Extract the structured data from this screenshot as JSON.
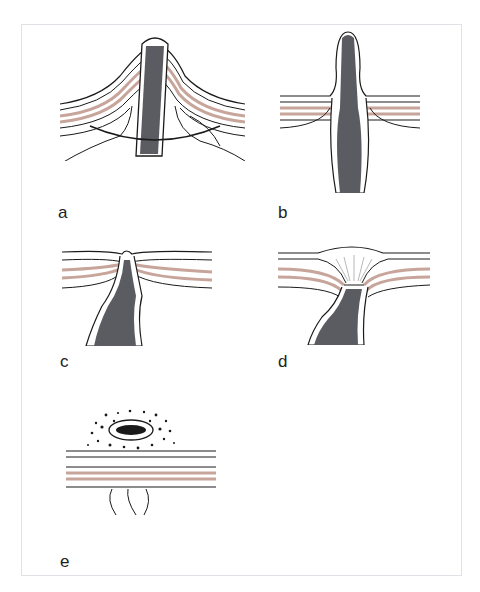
{
  "figure": {
    "panels": [
      {
        "id": "a",
        "label": "a",
        "description": "Bowel loop pulled through abdominal wall with rod/suture encircling"
      },
      {
        "id": "b",
        "label": "b",
        "description": "Everted bowel protruding through abdominal wall layers"
      },
      {
        "id": "c",
        "label": "c",
        "description": "Bowel retracted with layers converging at stoma"
      },
      {
        "id": "d",
        "label": "d",
        "description": "Stoma retracted below skin surface, depression in wall"
      },
      {
        "id": "e",
        "label": "e",
        "description": "Top view of stoma opening with surrounding granulation on abdominal wall"
      }
    ],
    "colors": {
      "line": "#1a1a1a",
      "bowel": "#5a5c62",
      "muscle": "#c7a59a",
      "frame": "#dfe3e8"
    }
  }
}
